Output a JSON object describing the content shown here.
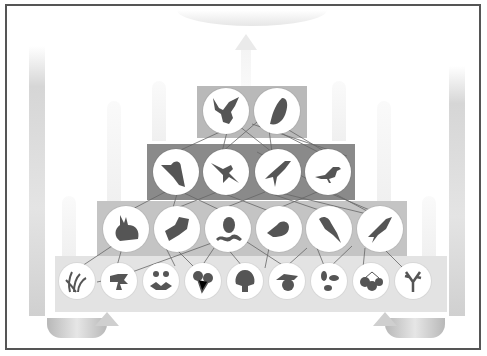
{
  "diagram": {
    "type": "food-web-pyramid",
    "colors": {
      "frame_border": "#555555",
      "tier_top": "#b9b9b9",
      "tier_secondary": "#8a8a8a",
      "tier_primary": "#c4c4c4",
      "tier_producers": "#e3e3e3",
      "silhouette": "#555555",
      "node_fill": "#ffffff",
      "link": "#666666"
    },
    "tiers": [
      {
        "level": "top-predators",
        "organisms": [
          {
            "name": "eagle",
            "icon": "eagle-icon"
          },
          {
            "name": "owl",
            "icon": "owl-icon"
          }
        ]
      },
      {
        "level": "secondary-consumers",
        "organisms": [
          {
            "name": "kingfisher",
            "icon": "kingfisher-icon"
          },
          {
            "name": "swallow",
            "icon": "swallow-icon"
          },
          {
            "name": "crow",
            "icon": "crow-icon"
          },
          {
            "name": "songbird",
            "icon": "songbird-icon"
          }
        ]
      },
      {
        "level": "primary-consumers",
        "organisms": [
          {
            "name": "rabbit",
            "icon": "rabbit-icon"
          },
          {
            "name": "moth",
            "icon": "moth-icon"
          },
          {
            "name": "beetle-and-caterpillar",
            "icon": "insect-icon"
          },
          {
            "name": "quail",
            "icon": "quail-icon"
          },
          {
            "name": "parrot",
            "icon": "parrot-icon"
          },
          {
            "name": "small-bird",
            "icon": "small-bird-icon"
          }
        ]
      },
      {
        "level": "producers",
        "organisms": [
          {
            "name": "grass",
            "icon": "grass-icon"
          },
          {
            "name": "shrub",
            "icon": "shrub-icon"
          },
          {
            "name": "dandelion",
            "icon": "dandelion-icon"
          },
          {
            "name": "flowers",
            "icon": "flower-icon"
          },
          {
            "name": "tree",
            "icon": "tree-icon"
          },
          {
            "name": "fruit",
            "icon": "fruit-icon"
          },
          {
            "name": "leaves",
            "icon": "leaves-icon"
          },
          {
            "name": "berries",
            "icon": "berries-icon"
          },
          {
            "name": "twig",
            "icon": "twig-icon"
          }
        ]
      }
    ],
    "cycle_arrows": [
      "energy-up-arrow",
      "left-recycle-arrow",
      "right-recycle-arrow"
    ]
  }
}
